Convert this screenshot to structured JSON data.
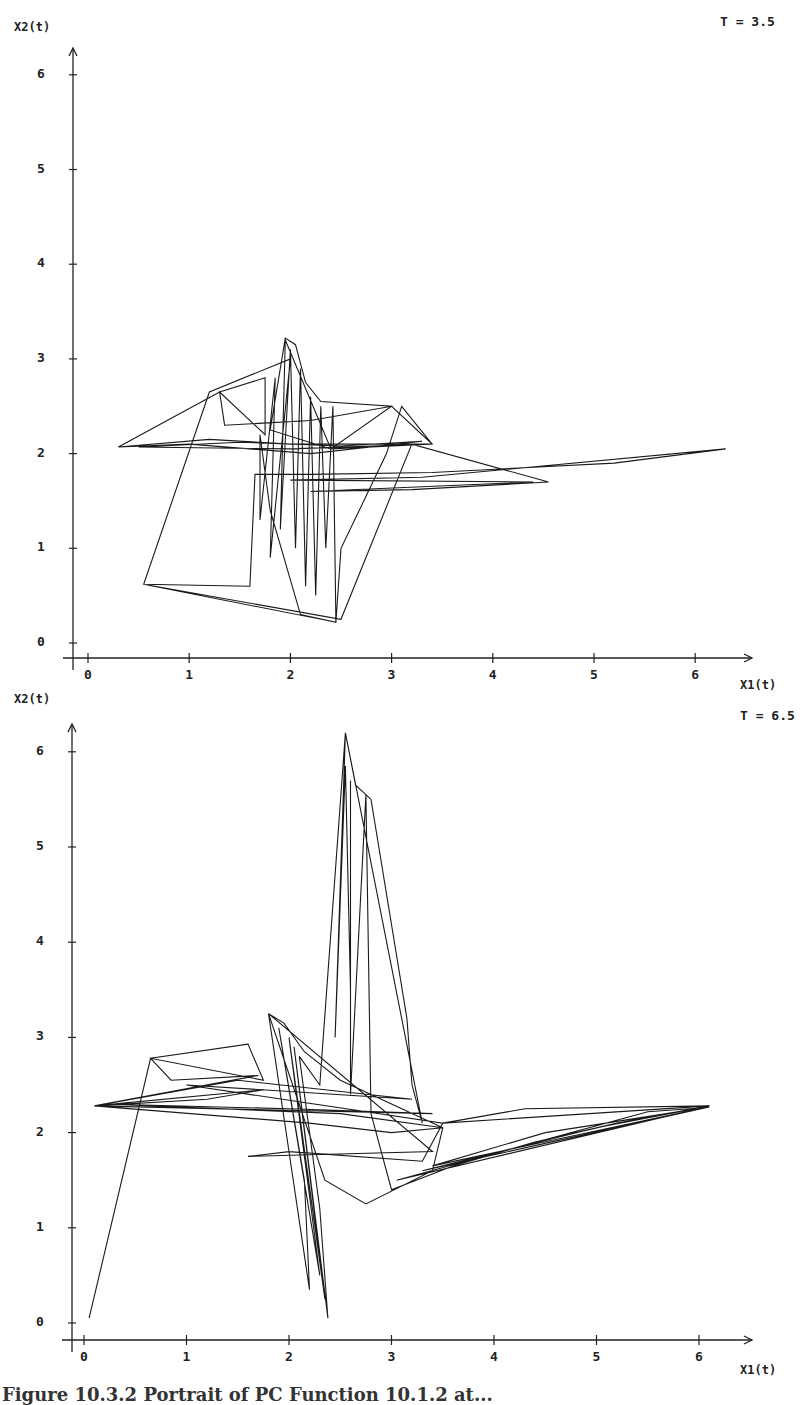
{
  "figure": {
    "caption": "Figure 10.3.2  Portrait of PC Function 10.1.2 at..."
  },
  "chart_data": [
    {
      "type": "line",
      "title": "T = 3.5",
      "xlabel": "X1(t)",
      "ylabel": "X2(t)",
      "xlim": [
        0,
        6.5
      ],
      "ylim": [
        0,
        6.3
      ],
      "xticks": [
        "0",
        "1",
        "2",
        "3",
        "4",
        "5",
        "6"
      ],
      "yticks": [
        "0",
        "1",
        "2",
        "3",
        "4",
        "5",
        "6"
      ],
      "grid": false,
      "legend": "none",
      "frame": {
        "ox": 88,
        "oy": 643,
        "sx": 101.2,
        "sy": 94.7,
        "axis_x": 73,
        "axis_y": 658,
        "top": 48,
        "right": 752
      },
      "series": [
        {
          "name": "phase trajectory",
          "points": [
            [
              0.3,
              2.07
            ],
            [
              1.2,
              2.15
            ],
            [
              2.0,
              2.1
            ],
            [
              3.4,
              2.1
            ],
            [
              2.0,
              2.05
            ],
            [
              0.5,
              2.07
            ],
            [
              1.5,
              2.12
            ],
            [
              2.5,
              2.08
            ],
            [
              3.3,
              2.13
            ],
            [
              2.2,
              2.0
            ],
            [
              1.0,
              2.1
            ],
            [
              0.3,
              2.07
            ],
            [
              1.3,
              2.65
            ],
            [
              1.75,
              2.8
            ],
            [
              1.75,
              2.2
            ],
            [
              1.3,
              2.65
            ],
            [
              1.35,
              2.3
            ],
            [
              2.2,
              2.35
            ],
            [
              3.0,
              2.5
            ],
            [
              3.4,
              2.1
            ],
            [
              2.4,
              2.05
            ],
            [
              1.8,
              2.25
            ],
            [
              1.95,
              3.22
            ],
            [
              2.05,
              3.15
            ],
            [
              2.15,
              2.75
            ],
            [
              2.3,
              2.55
            ],
            [
              3.0,
              2.5
            ],
            [
              2.4,
              2.05
            ],
            [
              1.95,
              3.2
            ],
            [
              1.9,
              1.2
            ],
            [
              2.0,
              3.1
            ],
            [
              2.05,
              1.0
            ],
            [
              2.1,
              2.9
            ],
            [
              2.15,
              0.6
            ],
            [
              2.2,
              2.6
            ],
            [
              2.25,
              0.5
            ],
            [
              2.3,
              2.5
            ],
            [
              2.35,
              1.0
            ],
            [
              2.42,
              2.5
            ],
            [
              2.45,
              0.22
            ],
            [
              2.1,
              0.3
            ],
            [
              1.8,
              1.4
            ],
            [
              1.7,
              2.2
            ],
            [
              1.7,
              1.3
            ],
            [
              1.85,
              2.8
            ],
            [
              1.8,
              0.9
            ],
            [
              2.0,
              3.0
            ],
            [
              1.2,
              2.65
            ],
            [
              0.55,
              0.62
            ],
            [
              1.6,
              0.6
            ],
            [
              1.65,
              1.78
            ],
            [
              2.2,
              1.78
            ],
            [
              3.4,
              1.8
            ],
            [
              4.3,
              1.85
            ],
            [
              5.2,
              1.9
            ],
            [
              6.3,
              2.05
            ],
            [
              3.3,
              1.75
            ],
            [
              2.0,
              1.72
            ],
            [
              4.4,
              1.7
            ],
            [
              2.2,
              1.6
            ],
            [
              3.2,
              1.62
            ],
            [
              4.55,
              1.7
            ],
            [
              3.2,
              2.1
            ],
            [
              2.5,
              0.25
            ],
            [
              0.55,
              0.62
            ],
            [
              2.45,
              0.22
            ],
            [
              2.5,
              1.0
            ],
            [
              2.95,
              2.0
            ],
            [
              3.1,
              2.5
            ],
            [
              3.4,
              2.1
            ]
          ]
        }
      ],
      "annotation": {
        "text": "T = 3.5",
        "position": "top-right"
      }
    },
    {
      "type": "line",
      "title": "T = 6.5",
      "xlabel": "X1(t)",
      "ylabel": "X2(t)",
      "xlim": [
        0,
        6.5
      ],
      "ylim": [
        0,
        6.3
      ],
      "xticks": [
        "0",
        "1",
        "2",
        "3",
        "4",
        "5",
        "6"
      ],
      "yticks": [
        "0",
        "1",
        "2",
        "3",
        "4",
        "5",
        "6"
      ],
      "grid": false,
      "legend": "none",
      "frame": {
        "ox": 84,
        "oy": 1323,
        "sx": 102.5,
        "sy": 95.2,
        "axis_x": 72,
        "axis_y": 1340,
        "top": 724,
        "right": 752
      },
      "series": [
        {
          "name": "phase trajectory",
          "points": [
            [
              0.05,
              0.05
            ],
            [
              0.65,
              2.78
            ],
            [
              1.6,
              2.93
            ],
            [
              1.75,
              2.55
            ],
            [
              0.65,
              2.78
            ],
            [
              0.85,
              2.55
            ],
            [
              1.7,
              2.6
            ],
            [
              0.1,
              2.28
            ],
            [
              1.2,
              2.35
            ],
            [
              1.75,
              2.45
            ],
            [
              0.1,
              2.28
            ],
            [
              2.2,
              2.1
            ],
            [
              3.0,
              2.0
            ],
            [
              3.5,
              2.05
            ],
            [
              2.5,
              2.2
            ],
            [
              0.2,
              2.3
            ],
            [
              2.0,
              2.25
            ],
            [
              3.4,
              2.2
            ],
            [
              0.1,
              2.28
            ],
            [
              1.5,
              2.55
            ],
            [
              3.2,
              2.35
            ],
            [
              1.0,
              2.5
            ],
            [
              3.5,
              2.1
            ],
            [
              3.3,
              1.7
            ],
            [
              2.0,
              1.8
            ],
            [
              1.6,
              1.75
            ],
            [
              3.4,
              1.8
            ],
            [
              1.8,
              3.25
            ],
            [
              1.95,
              3.15
            ],
            [
              2.15,
              2.85
            ],
            [
              2.5,
              2.55
            ],
            [
              3.0,
              2.3
            ],
            [
              3.5,
              2.05
            ],
            [
              3.4,
              1.6
            ],
            [
              2.75,
              1.25
            ],
            [
              2.35,
              1.5
            ],
            [
              1.8,
              3.25
            ],
            [
              2.2,
              0.35
            ],
            [
              2.15,
              1.5
            ],
            [
              1.9,
              3.1
            ],
            [
              2.3,
              0.5
            ],
            [
              2.0,
              3.0
            ],
            [
              2.35,
              0.25
            ],
            [
              2.05,
              2.9
            ],
            [
              2.38,
              0.05
            ],
            [
              2.3,
              1.2
            ],
            [
              2.1,
              2.8
            ],
            [
              2.3,
              2.5
            ],
            [
              2.55,
              6.2
            ],
            [
              2.65,
              5.65
            ],
            [
              2.75,
              5.55
            ],
            [
              2.8,
              5.5
            ],
            [
              3.15,
              3.2
            ],
            [
              3.2,
              2.5
            ],
            [
              3.3,
              2.1
            ],
            [
              2.55,
              6.2
            ],
            [
              2.45,
              3.0
            ],
            [
              2.55,
              5.85
            ],
            [
              2.6,
              3.5
            ],
            [
              2.6,
              5.7
            ],
            [
              2.6,
              2.4
            ],
            [
              2.75,
              5.55
            ],
            [
              2.8,
              2.2
            ],
            [
              3.0,
              1.4
            ],
            [
              3.6,
              1.65
            ],
            [
              4.4,
              1.9
            ],
            [
              5.2,
              2.1
            ],
            [
              6.1,
              2.28
            ],
            [
              4.3,
              2.25
            ],
            [
              3.5,
              2.1
            ],
            [
              6.1,
              2.28
            ],
            [
              5.0,
              2.05
            ],
            [
              3.3,
              1.6
            ],
            [
              6.1,
              2.27
            ],
            [
              4.5,
              2.0
            ],
            [
              3.4,
              1.65
            ],
            [
              6.05,
              2.26
            ],
            [
              5.5,
              2.22
            ],
            [
              3.05,
              1.5
            ],
            [
              6.0,
              2.25
            ]
          ]
        }
      ],
      "annotation": {
        "text": "T = 6.5",
        "position": "top-right"
      }
    }
  ]
}
